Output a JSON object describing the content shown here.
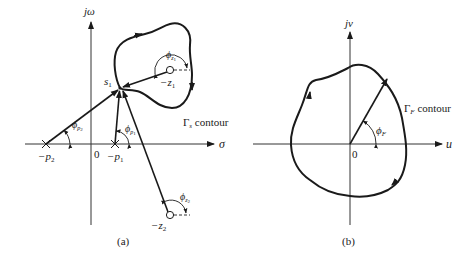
{
  "panel_a": {
    "caption": "(a)",
    "vertical_axis_label": "jω",
    "horizontal_axis_label": "σ",
    "origin_label": "0",
    "test_point_label": "s",
    "test_point_sub": "1",
    "contour_label_main": "Γ",
    "contour_label_sub": "s",
    "contour_label_text": " contour",
    "poles": [
      {
        "label": "−p",
        "sub": "2"
      },
      {
        "label": "−p",
        "sub": "1"
      }
    ],
    "zeros": [
      {
        "label": "−z",
        "sub": "1"
      },
      {
        "label": "−z",
        "sub": "2"
      }
    ],
    "angles": {
      "phi": "ϕ",
      "p2_sub": "p",
      "p2_subsub": "2",
      "p1_sub": "p",
      "p1_subsub": "1",
      "z1_sub": "z",
      "z1_subsub": "1",
      "z2_sub": "z",
      "z2_subsub": "2"
    }
  },
  "panel_b": {
    "caption": "(b)",
    "vertical_axis_label": "jv",
    "horizontal_axis_label": "u",
    "origin_label": "0",
    "contour_label_main": "Γ",
    "contour_label_sub": "F",
    "contour_label_text": " contour",
    "angle_phi": "ϕ",
    "angle_sub": "F"
  }
}
